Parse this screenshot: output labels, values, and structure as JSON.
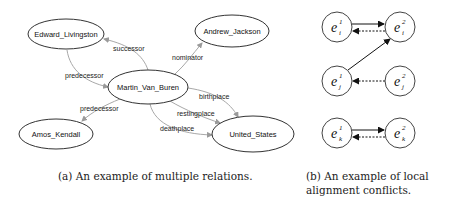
{
  "panel_a": {
    "nodes": [
      {
        "id": "edward",
        "label": "Edward_Livingston",
        "cx": 66,
        "cy": 34,
        "rx": 38,
        "ry": 15
      },
      {
        "id": "andrew",
        "label": "Andrew_Jackson",
        "cx": 232,
        "cy": 31,
        "rx": 37,
        "ry": 16
      },
      {
        "id": "martin",
        "label": "Martin_Van_Buren",
        "cx": 148,
        "cy": 87,
        "rx": 40,
        "ry": 17
      },
      {
        "id": "amos",
        "label": "Amos_Kendall",
        "cx": 56,
        "cy": 134,
        "rx": 37,
        "ry": 15
      },
      {
        "id": "us",
        "label": "United_States",
        "cx": 253,
        "cy": 134,
        "rx": 41,
        "ry": 18
      }
    ],
    "edges": [
      {
        "label": "successor",
        "from": "martin",
        "to": "edward"
      },
      {
        "label": "nominator",
        "from": "martin",
        "to": "andrew"
      },
      {
        "label": "predecessor",
        "from": "edward",
        "to": "martin"
      },
      {
        "label": "predecessor",
        "from": "martin",
        "to": "amos"
      },
      {
        "label": "birthplace",
        "from": "martin",
        "to": "us"
      },
      {
        "label": "restingplace",
        "from": "martin",
        "to": "us"
      },
      {
        "label": "deathplace",
        "from": "martin",
        "to": "us"
      }
    ],
    "caption": "(a) An example of multiple relations."
  },
  "panel_b": {
    "entities": [
      {
        "id": "ei1",
        "base": "e",
        "sup": "1",
        "sub": "i",
        "cx": 337,
        "cy": 27
      },
      {
        "id": "ei2",
        "base": "e",
        "sup": "2",
        "sub": "i",
        "cx": 400,
        "cy": 27
      },
      {
        "id": "ej1",
        "base": "e",
        "sup": "1",
        "sub": "j",
        "cx": 337,
        "cy": 81
      },
      {
        "id": "ej2",
        "base": "e",
        "sup": "2",
        "sub": "j",
        "cx": 400,
        "cy": 81
      },
      {
        "id": "ek1",
        "base": "e",
        "sup": "1",
        "sub": "k",
        "cx": 337,
        "cy": 133
      },
      {
        "id": "ek2",
        "base": "e",
        "sup": "2",
        "sub": "k",
        "cx": 400,
        "cy": 133
      }
    ],
    "arrows": [
      {
        "from": "ei1",
        "to": "ei2",
        "style": "solid"
      },
      {
        "from": "ei2",
        "to": "ei1",
        "style": "dashed"
      },
      {
        "from": "ej1",
        "to": "ei2",
        "style": "solid"
      },
      {
        "from": "ej2",
        "to": "ej1",
        "style": "dashed"
      },
      {
        "from": "ek1",
        "to": "ek2",
        "style": "solid"
      },
      {
        "from": "ek2",
        "to": "ek1",
        "style": "dashed"
      }
    ],
    "caption_line1": "(b) An example of local",
    "caption_line2": "alignment conflicts."
  }
}
